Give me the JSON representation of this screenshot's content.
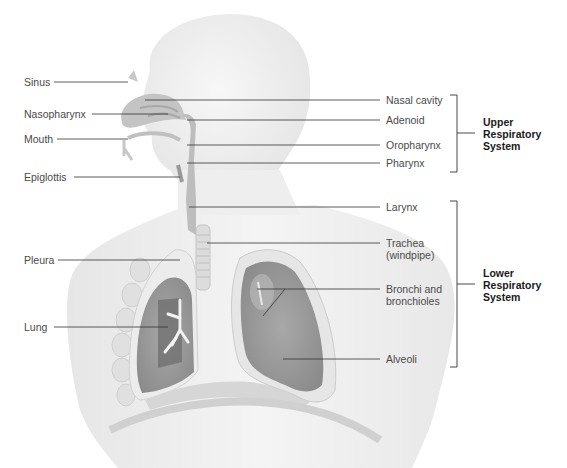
{
  "diagram": {
    "left_labels": [
      {
        "id": "sinus",
        "text": "Sinus"
      },
      {
        "id": "nasopharynx",
        "text": "Nasopharynx"
      },
      {
        "id": "mouth",
        "text": "Mouth"
      },
      {
        "id": "epiglottis",
        "text": "Epiglottis"
      },
      {
        "id": "pleura",
        "text": "Pleura"
      },
      {
        "id": "lung",
        "text": "Lung"
      }
    ],
    "right_labels": [
      {
        "id": "nasal-cavity",
        "text": "Nasal cavity"
      },
      {
        "id": "adenoid",
        "text": "Adenoid"
      },
      {
        "id": "oropharynx",
        "text": "Oropharynx"
      },
      {
        "id": "pharynx",
        "text": "Pharynx"
      },
      {
        "id": "larynx",
        "text": "Larynx"
      },
      {
        "id": "trachea",
        "text": "Trachea\n(windpipe)"
      },
      {
        "id": "bronchi",
        "text": "Bronchi and\nbronchioles"
      },
      {
        "id": "alveoli",
        "text": "Alveoli"
      }
    ],
    "groups": [
      {
        "id": "upper",
        "text": "Upper\nRespiratory\nSystem",
        "members": [
          "Nasal cavity",
          "Adenoid",
          "Oropharynx",
          "Pharynx"
        ]
      },
      {
        "id": "lower",
        "text": "Lower\nRespiratory\nSystem",
        "members": [
          "Larynx",
          "Trachea (windpipe)",
          "Bronchi and bronchioles",
          "Alveoli"
        ]
      }
    ],
    "colors": {
      "body": "#f0f0f0",
      "body_edge": "#d8d8d8",
      "airway": "#b8b8b8",
      "lung": "#9c9c9c",
      "lung_dark": "#6e6e6e",
      "pleura": "#e4e4e4",
      "leader": "#333333",
      "text": "#4a4a4a"
    }
  }
}
